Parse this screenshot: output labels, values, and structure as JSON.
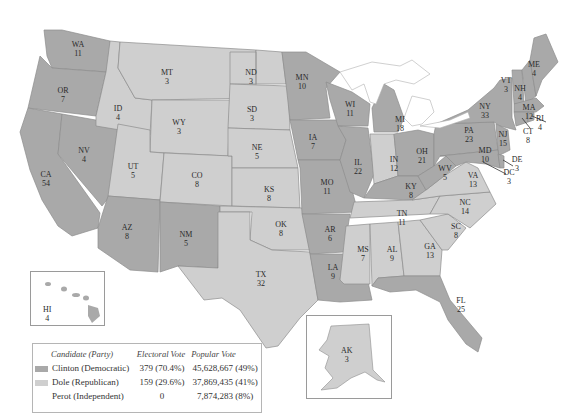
{
  "colors": {
    "democratic": "#a9a9a9",
    "republican": "#cfcfcf",
    "background": "#ffffff",
    "lakes": "#ffffff"
  },
  "states": [
    {
      "abbr": "WA",
      "ev": "11",
      "party": "D"
    },
    {
      "abbr": "OR",
      "ev": "7",
      "party": "D"
    },
    {
      "abbr": "CA",
      "ev": "54",
      "party": "D"
    },
    {
      "abbr": "NV",
      "ev": "4",
      "party": "D"
    },
    {
      "abbr": "ID",
      "ev": "4",
      "party": "R"
    },
    {
      "abbr": "MT",
      "ev": "3",
      "party": "R"
    },
    {
      "abbr": "WY",
      "ev": "3",
      "party": "R"
    },
    {
      "abbr": "UT",
      "ev": "5",
      "party": "R"
    },
    {
      "abbr": "AZ",
      "ev": "8",
      "party": "D"
    },
    {
      "abbr": "CO",
      "ev": "8",
      "party": "R"
    },
    {
      "abbr": "NM",
      "ev": "5",
      "party": "D"
    },
    {
      "abbr": "ND",
      "ev": "3",
      "party": "R"
    },
    {
      "abbr": "SD",
      "ev": "3",
      "party": "R"
    },
    {
      "abbr": "NE",
      "ev": "5",
      "party": "R"
    },
    {
      "abbr": "KS",
      "ev": "8",
      "party": "R"
    },
    {
      "abbr": "OK",
      "ev": "8",
      "party": "R"
    },
    {
      "abbr": "TX",
      "ev": "32",
      "party": "R"
    },
    {
      "abbr": "MN",
      "ev": "10",
      "party": "D"
    },
    {
      "abbr": "IA",
      "ev": "7",
      "party": "D"
    },
    {
      "abbr": "MO",
      "ev": "11",
      "party": "D"
    },
    {
      "abbr": "AR",
      "ev": "6",
      "party": "D"
    },
    {
      "abbr": "LA",
      "ev": "9",
      "party": "D"
    },
    {
      "abbr": "WI",
      "ev": "11",
      "party": "D"
    },
    {
      "abbr": "IL",
      "ev": "22",
      "party": "D"
    },
    {
      "abbr": "MI",
      "ev": "18",
      "party": "D"
    },
    {
      "abbr": "IN",
      "ev": "12",
      "party": "R"
    },
    {
      "abbr": "OH",
      "ev": "21",
      "party": "D"
    },
    {
      "abbr": "KY",
      "ev": "8",
      "party": "D"
    },
    {
      "abbr": "TN",
      "ev": "11",
      "party": "D"
    },
    {
      "abbr": "MS",
      "ev": "7",
      "party": "R"
    },
    {
      "abbr": "AL",
      "ev": "9",
      "party": "R"
    },
    {
      "abbr": "GA",
      "ev": "13",
      "party": "R"
    },
    {
      "abbr": "FL",
      "ev": "25",
      "party": "D"
    },
    {
      "abbr": "SC",
      "ev": "8",
      "party": "R"
    },
    {
      "abbr": "NC",
      "ev": "14",
      "party": "R"
    },
    {
      "abbr": "VA",
      "ev": "13",
      "party": "R"
    },
    {
      "abbr": "WV",
      "ev": "5",
      "party": "D"
    },
    {
      "abbr": "PA",
      "ev": "23",
      "party": "D"
    },
    {
      "abbr": "NY",
      "ev": "33",
      "party": "D"
    },
    {
      "abbr": "NJ",
      "ev": "15",
      "party": "D"
    },
    {
      "abbr": "MD",
      "ev": "10",
      "party": "D"
    },
    {
      "abbr": "DE",
      "ev": "3",
      "party": "D"
    },
    {
      "abbr": "DC",
      "ev": "3",
      "party": "D"
    },
    {
      "abbr": "VT",
      "ev": "3",
      "party": "D"
    },
    {
      "abbr": "NH",
      "ev": "4",
      "party": "D"
    },
    {
      "abbr": "ME",
      "ev": "4",
      "party": "D"
    },
    {
      "abbr": "MA",
      "ev": "12",
      "party": "D"
    },
    {
      "abbr": "RI",
      "ev": "4",
      "party": "D"
    },
    {
      "abbr": "CT",
      "ev": "8",
      "party": "D"
    },
    {
      "abbr": "AK",
      "ev": "3",
      "party": "R"
    },
    {
      "abbr": "HI",
      "ev": "4",
      "party": "D"
    }
  ],
  "legend": {
    "headers": {
      "candidate": "Candidate (Party)",
      "electoral": "Electoral Vote",
      "popular": "Popular Vote"
    },
    "rows": [
      {
        "candidate": "Clinton (Democratic)",
        "electoral": "379 (70.4%)",
        "popular": "45,628,667 (49%)",
        "swatch": "democratic"
      },
      {
        "candidate": "Dole (Republican)",
        "electoral": "159 (29.6%)",
        "popular": "37,869,435 (41%)",
        "swatch": "republican"
      },
      {
        "candidate": "Perot (Independent)",
        "electoral": "0",
        "popular": "7,874,283 (8%)",
        "swatch": "none"
      }
    ]
  }
}
